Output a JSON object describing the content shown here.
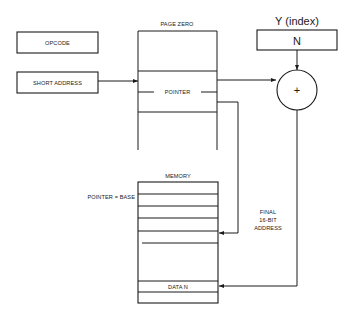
{
  "diagram": {
    "opcode_box": {
      "label": "OPCODE"
    },
    "short_address_box": {
      "label": "SHORT ADDRESS"
    },
    "page_zero": {
      "title": "PAGE ZERO",
      "pointer_label": "POINTER"
    },
    "index_register": {
      "title": "Y (index)",
      "value": "N"
    },
    "adder": {
      "symbol": "+"
    },
    "memory": {
      "title": "MEMORY",
      "base_label": "POINTER = BASE",
      "data_label": "DATA N"
    },
    "final_address": {
      "line1": "FINAL",
      "line2": "16-BIT",
      "line3": "ADDRESS"
    }
  }
}
